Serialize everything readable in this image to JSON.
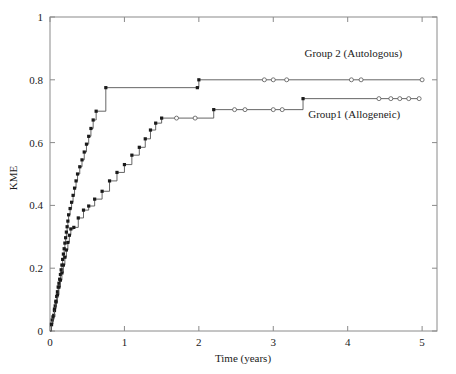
{
  "chart_data": {
    "type": "line",
    "title": "",
    "xlabel": "Time (years)",
    "ylabel": "KME",
    "xlim": [
      0,
      5.2
    ],
    "ylim": [
      0,
      1
    ],
    "grid": false,
    "legend_position": "inline-annotation",
    "xticks": [
      0,
      1,
      2,
      3,
      4,
      5
    ],
    "xtick_labels": [
      "0",
      "1",
      "2",
      "3",
      "4",
      "5"
    ],
    "yticks": [
      0,
      0.2,
      0.4,
      0.6,
      0.8,
      1
    ],
    "ytick_labels": [
      "0",
      "0.2",
      "0.4",
      "0.6",
      "0.8",
      "1"
    ],
    "series": [
      {
        "name": "Group 2 (Autologous)",
        "label": "Group 2 (Autologous)",
        "label_x": 3.42,
        "label_y": 0.885,
        "marker_event": "filled-square",
        "marker_censored": "open-circle",
        "x": [
          0.02,
          0.03,
          0.05,
          0.06,
          0.07,
          0.08,
          0.09,
          0.1,
          0.11,
          0.12,
          0.13,
          0.14,
          0.15,
          0.16,
          0.17,
          0.18,
          0.19,
          0.2,
          0.21,
          0.22,
          0.23,
          0.24,
          0.25,
          0.27,
          0.29,
          0.31,
          0.33,
          0.35,
          0.37,
          0.4,
          0.43,
          0.46,
          0.49,
          0.52,
          0.55,
          0.58,
          0.62,
          0.75,
          1.98,
          2.0
        ],
        "y": [
          0.02,
          0.035,
          0.05,
          0.065,
          0.08,
          0.095,
          0.11,
          0.125,
          0.14,
          0.152,
          0.165,
          0.18,
          0.195,
          0.21,
          0.228,
          0.245,
          0.262,
          0.28,
          0.297,
          0.315,
          0.332,
          0.35,
          0.37,
          0.39,
          0.41,
          0.432,
          0.455,
          0.478,
          0.5,
          0.523,
          0.545,
          0.57,
          0.595,
          0.62,
          0.645,
          0.672,
          0.7,
          0.775,
          0.775,
          0.8
        ],
        "censored_x": [
          2.88,
          3.0,
          3.18,
          4.05,
          4.18,
          5.0
        ],
        "censored_y": [
          0.8,
          0.8,
          0.8,
          0.8,
          0.8,
          0.8
        ],
        "plateau_value": 0.8,
        "plateau_start": 2.0,
        "plateau_end": 5.0
      },
      {
        "name": "Group1 (Allogeneic)",
        "label": "Group1 (Allogeneic)",
        "label_x": 3.47,
        "label_y": 0.692,
        "marker_event": "filled-square",
        "marker_censored": "open-circle",
        "x": [
          0.02,
          0.04,
          0.06,
          0.08,
          0.1,
          0.12,
          0.14,
          0.16,
          0.18,
          0.2,
          0.22,
          0.24,
          0.26,
          0.28,
          0.32,
          0.38,
          0.45,
          0.52,
          0.6,
          0.7,
          0.8,
          0.9,
          1.0,
          1.1,
          1.2,
          1.28,
          1.35,
          1.42,
          1.5,
          2.2,
          3.4
        ],
        "y": [
          0.022,
          0.045,
          0.07,
          0.092,
          0.115,
          0.14,
          0.162,
          0.185,
          0.21,
          0.235,
          0.258,
          0.282,
          0.305,
          0.325,
          0.33,
          0.36,
          0.385,
          0.398,
          0.42,
          0.445,
          0.478,
          0.505,
          0.53,
          0.56,
          0.585,
          0.612,
          0.64,
          0.662,
          0.678,
          0.705,
          0.74
        ],
        "censored_x": [
          1.7,
          1.95,
          2.48,
          2.62,
          3.0,
          3.12,
          4.42,
          4.58,
          4.7,
          4.82,
          4.96
        ],
        "censored_y": [
          0.678,
          0.678,
          0.705,
          0.705,
          0.705,
          0.705,
          0.74,
          0.74,
          0.74,
          0.74,
          0.74
        ],
        "plateau_value": 0.74,
        "plateau_start": 3.4,
        "plateau_end": 4.96
      }
    ],
    "colors": {
      "line": "#555555",
      "event_marker": "#1a1a1a",
      "censored_marker_fill": "#ffffff",
      "axis": "#8a8a8a",
      "text": "#1a1a1a",
      "background": "#ffffff"
    }
  }
}
